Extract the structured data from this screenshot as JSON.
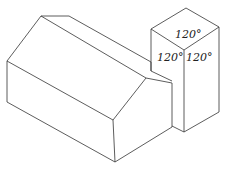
{
  "diagram": {
    "labels": {
      "top_angle": "120°",
      "left_angle": "120°",
      "right_angle": "120°"
    },
    "stroke_color": "#333333"
  }
}
